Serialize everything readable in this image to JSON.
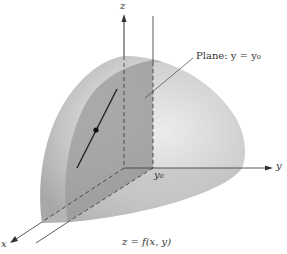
{
  "figure": {
    "axes": {
      "z": "z",
      "y": "y",
      "x": "x"
    },
    "plane_label": "Plane:  y = y₀",
    "y0_label": "y₀",
    "caption": "z = f(x, y)"
  },
  "colors": {
    "surface": "#c8c8c8",
    "surface_dark": "#a9a9a9",
    "cut_plane": "#9c9c9c",
    "line": "#333333"
  }
}
